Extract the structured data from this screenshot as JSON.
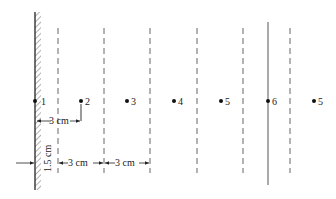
{
  "diagram": {
    "type": "mirror-image-construction",
    "wall": {
      "hatched": true,
      "x": 35
    },
    "dashed_lines_x": [
      58,
      104,
      150,
      197,
      243,
      290
    ],
    "mirror_line_x": 268,
    "points": [
      {
        "label": "1",
        "x": 35
      },
      {
        "label": "2",
        "x": 81
      },
      {
        "label": "3",
        "x": 127
      },
      {
        "label": "4",
        "x": 174
      },
      {
        "label": "5",
        "x": 221
      },
      {
        "label": "6",
        "x": 268
      },
      {
        "label": "5",
        "x": 314
      }
    ],
    "point_y": 101,
    "dimensions": {
      "wall_to_point2": "3 cm",
      "wall_to_first_line": "1.5 cm",
      "line_spacing_1": "3 cm",
      "line_spacing_2": "3 cm"
    },
    "colors": {
      "ink": "#222222",
      "dashed": "#555555",
      "background": "#ffffff"
    }
  }
}
